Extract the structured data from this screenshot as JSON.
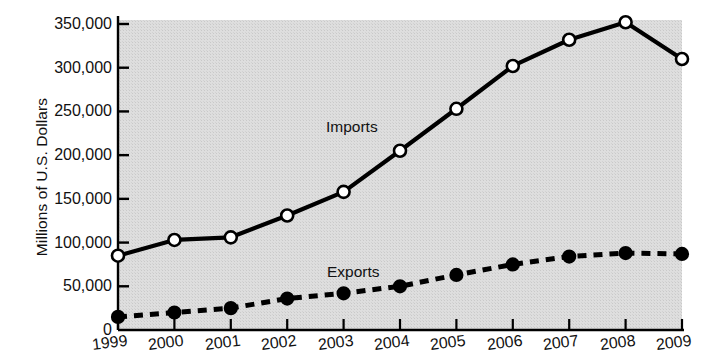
{
  "chart_data": {
    "type": "line",
    "title": "",
    "xlabel": "",
    "ylabel": "Millions of U.S. Dollars",
    "categories": [
      "1999",
      "2000",
      "2001",
      "2002",
      "2003",
      "2004",
      "2005",
      "2006",
      "2007",
      "2008",
      "2009"
    ],
    "x": [
      1999,
      2000,
      2001,
      2002,
      2003,
      2004,
      2005,
      2006,
      2007,
      2008,
      2009
    ],
    "ylim": [
      0,
      350000
    ],
    "yticks": [
      0,
      50000,
      100000,
      150000,
      200000,
      250000,
      300000,
      350000
    ],
    "ytick_labels": [
      "0",
      "50,000",
      "100,000",
      "150,000",
      "200,000",
      "250,000",
      "300,000",
      "350,000"
    ],
    "grid": false,
    "legend_position": "inline-annotation",
    "plot_background": "#dcdcdc",
    "series": [
      {
        "name": "Imports",
        "marker": "open-circle",
        "linestyle": "solid",
        "color": "#000000",
        "values": [
          85000,
          103000,
          106000,
          131000,
          158000,
          205000,
          253000,
          302000,
          332000,
          352000,
          310000
        ]
      },
      {
        "name": "Exports",
        "marker": "filled-circle",
        "linestyle": "dashed",
        "color": "#000000",
        "values": [
          15000,
          20000,
          25000,
          36000,
          42000,
          50000,
          63000,
          75000,
          84000,
          88000,
          87000
        ]
      }
    ],
    "annotations": [
      {
        "text": "Imports",
        "series": "Imports"
      },
      {
        "text": "Exports",
        "series": "Exports"
      }
    ]
  }
}
